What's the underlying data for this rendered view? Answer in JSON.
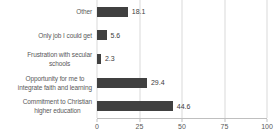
{
  "colors": {
    "bar": "#404040",
    "value_label": "#404040",
    "axis_text": "#595959",
    "gridline": "#d9d9d9",
    "axis_line": "#bfbfbf",
    "background": "#ffffff"
  },
  "chart_data": {
    "type": "bar",
    "orientation": "horizontal",
    "title": "",
    "xlabel": "",
    "ylabel": "",
    "categories": [
      "Other",
      "Only job I could get",
      "Frustration with secular schools",
      "Opportunity for me to integrate faith and learning",
      "Commitment to Christian higher education"
    ],
    "category_lines": [
      [
        "Other"
      ],
      [
        "Only job I could get"
      ],
      [
        "Frustration with secular",
        "schools"
      ],
      [
        "Opportunity for me to",
        "integrate faith and learning"
      ],
      [
        "Commitment to Christian",
        "higher education"
      ]
    ],
    "values": [
      18.1,
      5.6,
      2.3,
      29.4,
      44.6
    ],
    "value_labels": [
      "18.1",
      "5.6",
      "2.3",
      "29.4",
      "44.6"
    ],
    "xlim": [
      0,
      100
    ],
    "x_ticks": [
      0,
      25,
      50,
      75,
      100
    ],
    "x_tick_labels": [
      "0",
      "25",
      "50",
      "75",
      "100"
    ],
    "grid": true,
    "legend": false
  }
}
